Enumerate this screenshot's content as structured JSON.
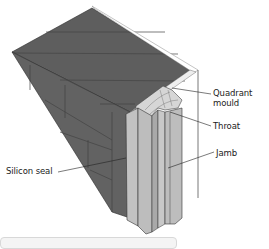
{
  "figure": {
    "labels": {
      "quadrant_mould_line1": "Quadrant",
      "quadrant_mould_line2": "mould",
      "throat": "Throat",
      "jamb": "Jamb",
      "silicon_seal": "Silicon seal"
    },
    "colors": {
      "masonry": "#5e5e5e",
      "masonry_joint": "#3e3e3e",
      "timber_face": "#bdbdbd",
      "timber_light": "#d6d6d6",
      "outline": "#2a2a2a"
    }
  }
}
